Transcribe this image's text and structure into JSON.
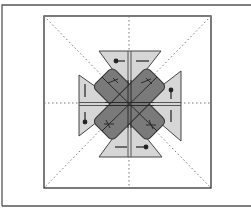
{
  "figure": {
    "colors": {
      "background": "#ffffff",
      "frame": "#555555",
      "square_border": "#333333",
      "fold_line": "#777777",
      "flap_fill": "#d6d6d6",
      "flap_stroke": "#444444",
      "center_fill": "#7a7a7a",
      "center_stroke": "#333333",
      "mark": "#222222"
    },
    "outer_frame": {
      "x": 2,
      "y": 5,
      "right": 251,
      "bottom": 206
    },
    "square": {
      "x": 44,
      "y": 16,
      "w": 167,
      "h": 172
    },
    "center": {
      "x": 129,
      "y": 104
    },
    "flaps": [
      {
        "name": "top",
        "points": "99,51 161,51 129,92"
      },
      {
        "name": "left",
        "points": "79,75 79,136 120,104"
      },
      {
        "name": "right",
        "points": "181,71 181,141 138,104"
      },
      {
        "name": "bottom",
        "points": "99,157 162,157 129,116"
      }
    ],
    "arrows": [
      {
        "name": "top-arrow",
        "x1": 116,
        "y1": 61,
        "x2": 129,
        "y2": 61,
        "dot": [
          116,
          61
        ],
        "dash": [
          136,
          61,
          149,
          61
        ]
      },
      {
        "name": "left-arrow",
        "x1": 85,
        "y1": 113,
        "x2": 85,
        "y2": 123,
        "dot": [
          85,
          122
        ],
        "dash": [
          85,
          84,
          85,
          97
        ]
      },
      {
        "name": "right-arrow",
        "x1": 171,
        "y1": 90,
        "x2": 171,
        "y2": 99,
        "dot": [
          171,
          90
        ],
        "dash": [
          171,
          110,
          171,
          122
        ]
      },
      {
        "name": "bottom-arrow",
        "x1": 134,
        "y1": 147,
        "x2": 146,
        "y2": 147,
        "dot": [
          146,
          147
        ],
        "dash": [
          115,
          147,
          127,
          147
        ]
      }
    ]
  }
}
